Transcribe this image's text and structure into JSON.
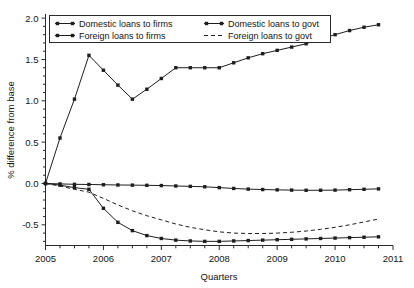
{
  "chart_data": {
    "type": "line",
    "title": "",
    "xlabel": "Quarters",
    "ylabel": "% difference from base",
    "xlim": [
      2005,
      2011
    ],
    "ylim": [
      -0.75,
      2.05
    ],
    "yticks": [
      "2.0",
      "1.5",
      "1.0",
      "0.5",
      "0.0",
      "-0.5"
    ],
    "ytick_values": [
      2.0,
      1.5,
      1.0,
      0.5,
      0.0,
      -0.5
    ],
    "xticks": [
      "2005",
      "2006",
      "2007",
      "2008",
      "2009",
      "2010",
      "2011"
    ],
    "xtick_values": [
      2005,
      2006,
      2007,
      2008,
      2009,
      2010,
      2011
    ],
    "grid": false,
    "legend_position": "top-left",
    "x": [
      2005.0,
      2005.25,
      2005.5,
      2005.75,
      2006.0,
      2006.25,
      2006.5,
      2006.75,
      2007.0,
      2007.25,
      2007.5,
      2007.75,
      2008.0,
      2008.25,
      2008.5,
      2008.75,
      2009.0,
      2009.25,
      2009.5,
      2009.75,
      2010.0,
      2010.25,
      2010.5,
      2010.75
    ],
    "series": [
      {
        "name": "Domestic loans to firms",
        "marker": "square",
        "style": "solid",
        "values": [
          0.0,
          0.55,
          1.02,
          1.55,
          1.37,
          1.19,
          1.02,
          1.14,
          1.27,
          1.4,
          1.4,
          1.4,
          1.4,
          1.46,
          1.52,
          1.57,
          1.61,
          1.65,
          1.69,
          1.75,
          1.8,
          1.85,
          1.89,
          1.92
        ]
      },
      {
        "name": "Domestic loans to govt",
        "marker": "square",
        "style": "solid",
        "values": [
          0.0,
          -0.005,
          -0.01,
          -0.012,
          -0.015,
          -0.018,
          -0.02,
          -0.022,
          -0.025,
          -0.03,
          -0.035,
          -0.04,
          -0.05,
          -0.06,
          -0.068,
          -0.073,
          -0.077,
          -0.08,
          -0.082,
          -0.082,
          -0.08,
          -0.075,
          -0.07,
          -0.065
        ]
      },
      {
        "name": "Foreign loans to firms",
        "marker": "square",
        "style": "solid",
        "values": [
          0.0,
          -0.02,
          -0.05,
          -0.07,
          -0.3,
          -0.47,
          -0.57,
          -0.63,
          -0.665,
          -0.685,
          -0.695,
          -0.7,
          -0.7,
          -0.695,
          -0.69,
          -0.685,
          -0.68,
          -0.675,
          -0.67,
          -0.665,
          -0.66,
          -0.655,
          -0.65,
          -0.645
        ]
      },
      {
        "name": "Foreign loans to govt",
        "marker": "none",
        "style": "dashed",
        "values": [
          0.0,
          -0.03,
          -0.07,
          -0.105,
          -0.18,
          -0.26,
          -0.33,
          -0.39,
          -0.44,
          -0.49,
          -0.53,
          -0.56,
          -0.585,
          -0.6,
          -0.605,
          -0.605,
          -0.6,
          -0.59,
          -0.575,
          -0.555,
          -0.53,
          -0.5,
          -0.465,
          -0.43
        ]
      }
    ]
  },
  "legend": {
    "entries": [
      {
        "label": "Domestic loans to firms"
      },
      {
        "label": "Domestic loans to govt"
      },
      {
        "label": "Foreign loans to firms"
      },
      {
        "label": "Foreign loans to govt"
      }
    ]
  },
  "colors": {
    "line": "#1e1e1e",
    "frame": "#2b2b2b",
    "background": "#ffffff"
  }
}
